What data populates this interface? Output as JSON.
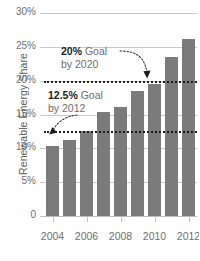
{
  "chart_data": {
    "type": "bar",
    "title": "",
    "xlabel": "",
    "ylabel": "Renewable Energy Share",
    "categories": [
      "2004",
      "2005",
      "2006",
      "2007",
      "2008",
      "2009",
      "2010",
      "2011",
      "2012"
    ],
    "values": [
      10.4,
      11.3,
      12.5,
      15.4,
      16.1,
      18.5,
      19.5,
      23.5,
      26.2
    ],
    "ylim": [
      0,
      30
    ],
    "yticks": [
      0,
      5,
      10,
      15,
      20,
      25,
      30
    ],
    "ytick_labels": [
      "0",
      "5%",
      "10%",
      "15%",
      "20%",
      "25%",
      "30%"
    ],
    "xtick_labels": [
      "2004",
      "2006",
      "2008",
      "2010",
      "2012"
    ],
    "grid": true,
    "legend": "none",
    "bar_color": "#7b7b7b",
    "reference_lines": [
      {
        "name": "goal-2020",
        "value": 20,
        "label": "20% Goal by 2020",
        "style": "dotted",
        "color": "#1c1c1c"
      },
      {
        "name": "goal-2012",
        "value": 12.5,
        "label": "12.5% Goal by 2012",
        "style": "dotted",
        "color": "#1c1c1c"
      }
    ],
    "annotations": [
      {
        "name": "goal-2020-annotation",
        "bold_text": "20%",
        "text": " Goal",
        "line2": "by 2020"
      },
      {
        "name": "goal-2012-annotation",
        "bold_text": "12.5%",
        "text": " Goal",
        "line2": "by 2012"
      }
    ]
  },
  "axes": {
    "y_title": "Renewable Energy Share",
    "y_labels": [
      "30%",
      "25%",
      "20%",
      "15%",
      "10%",
      "5%",
      "0"
    ],
    "x_labels": [
      "2004",
      "2006",
      "2008",
      "2010",
      "2012"
    ]
  },
  "annotations": {
    "goal_2020": {
      "bold": "20%",
      "rest": " Goal",
      "line2": "by 2020"
    },
    "goal_2012": {
      "bold": "12.5%",
      "rest": " Goal",
      "line2": "by 2012"
    }
  }
}
